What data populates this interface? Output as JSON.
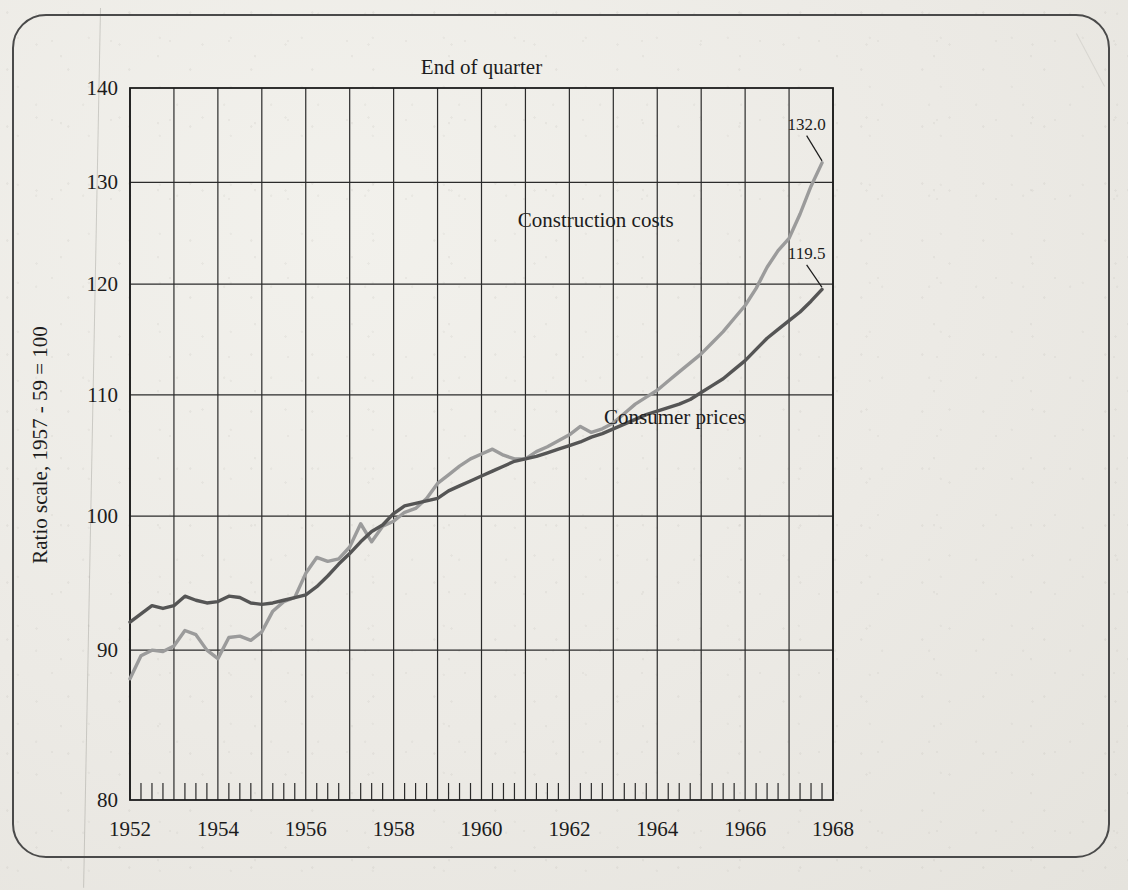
{
  "figure": {
    "plot_title": "End of quarter",
    "y_axis_title": "Ratio scale, 1957 - 59 = 100",
    "series_labels": {
      "construction": "Construction costs",
      "consumer": "Consumer prices"
    },
    "end_values": {
      "construction": "132.0",
      "consumer": "119.5"
    },
    "colors": {
      "construction": "#9b9b9b",
      "consumer": "#555555",
      "grid": "#2b2b2b",
      "axis": "#1c1c1c",
      "paper": "#eceae5",
      "frame": "#4a4a4a"
    }
  },
  "chart_data": {
    "type": "line",
    "title": "End of quarter",
    "xlabel": "",
    "ylabel": "Ratio scale, 1957 - 59 = 100",
    "yscale": "log",
    "ylim": [
      80,
      140
    ],
    "xlim": [
      1952,
      1968
    ],
    "grid": true,
    "legend": "inline-annotations",
    "y_ticks": [
      80,
      90,
      100,
      110,
      120,
      130,
      140
    ],
    "y_tick_labels": [
      "80",
      "90",
      "100",
      "110",
      "120",
      "130",
      "140"
    ],
    "x_ticks": [
      1952,
      1954,
      1956,
      1958,
      1960,
      1962,
      1964,
      1966,
      1968
    ],
    "x_tick_labels": [
      "1952",
      "1954",
      "1956",
      "1958",
      "1960",
      "1962",
      "1964",
      "1966",
      "1968"
    ],
    "x_minor_tick_interval_years": 0.25,
    "x_gridline_interval_years": 1,
    "x": [
      1952.0,
      1952.25,
      1952.5,
      1952.75,
      1953.0,
      1953.25,
      1953.5,
      1953.75,
      1954.0,
      1954.25,
      1954.5,
      1954.75,
      1955.0,
      1955.25,
      1955.5,
      1955.75,
      1956.0,
      1956.25,
      1956.5,
      1956.75,
      1957.0,
      1957.25,
      1957.5,
      1957.75,
      1958.0,
      1958.25,
      1958.5,
      1958.75,
      1959.0,
      1959.25,
      1959.5,
      1959.75,
      1960.0,
      1960.25,
      1960.5,
      1960.75,
      1961.0,
      1961.25,
      1961.5,
      1961.75,
      1962.0,
      1962.25,
      1962.5,
      1962.75,
      1963.0,
      1963.25,
      1963.5,
      1963.75,
      1964.0,
      1964.25,
      1964.5,
      1964.75,
      1965.0,
      1965.25,
      1965.5,
      1965.75,
      1966.0,
      1966.25,
      1966.5,
      1966.75,
      1967.0,
      1967.25,
      1967.5,
      1967.75
    ],
    "series": [
      {
        "name": "Construction costs",
        "color": "#9b9b9b",
        "end_value": 132.0,
        "values": [
          88.0,
          89.6,
          90.0,
          89.9,
          90.3,
          91.4,
          91.1,
          90.0,
          89.4,
          90.9,
          91.0,
          90.7,
          91.3,
          92.8,
          93.5,
          93.8,
          95.6,
          96.8,
          96.5,
          96.7,
          97.6,
          99.4,
          98.0,
          99.2,
          99.6,
          100.3,
          100.6,
          101.4,
          102.6,
          103.3,
          104.0,
          104.6,
          105.0,
          105.4,
          104.9,
          104.6,
          104.6,
          105.2,
          105.6,
          106.1,
          106.6,
          107.3,
          106.8,
          107.1,
          107.6,
          108.4,
          109.2,
          109.8,
          110.4,
          111.2,
          112.0,
          112.8,
          113.6,
          114.6,
          115.6,
          116.8,
          118.0,
          119.6,
          121.6,
          123.2,
          124.4,
          126.8,
          129.6,
          132.0
        ]
      },
      {
        "name": "Consumer prices",
        "color": "#555555",
        "end_value": 119.5,
        "values": [
          92.0,
          92.6,
          93.2,
          93.0,
          93.2,
          93.9,
          93.6,
          93.4,
          93.5,
          93.9,
          93.8,
          93.4,
          93.3,
          93.4,
          93.6,
          93.8,
          94.0,
          94.6,
          95.4,
          96.3,
          97.1,
          98.0,
          98.8,
          99.3,
          100.2,
          100.8,
          101.0,
          101.2,
          101.4,
          102.0,
          102.4,
          102.8,
          103.2,
          103.6,
          104.0,
          104.4,
          104.6,
          104.8,
          105.1,
          105.4,
          105.7,
          106.0,
          106.4,
          106.7,
          107.1,
          107.5,
          107.9,
          108.3,
          108.6,
          108.9,
          109.2,
          109.6,
          110.2,
          110.8,
          111.4,
          112.2,
          113.0,
          114.0,
          115.0,
          115.8,
          116.6,
          117.4,
          118.4,
          119.5
        ]
      }
    ],
    "annotations": [
      {
        "text": "Construction costs",
        "x": 1962.6,
        "y": 125.5
      },
      {
        "text": "Consumer prices",
        "x": 1964.4,
        "y": 107.5
      },
      {
        "text": "132.0",
        "x": 1967.4,
        "y": 135.5
      },
      {
        "text": "119.5",
        "x": 1967.4,
        "y": 122.4
      }
    ]
  }
}
